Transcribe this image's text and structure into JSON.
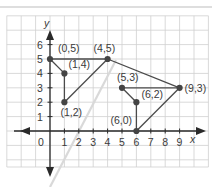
{
  "figure": {
    "title": "",
    "axes": {
      "x_label": "x",
      "y_label": "y",
      "x_ticks": [
        "1",
        "2",
        "3",
        "4",
        "5",
        "6",
        "7",
        "8",
        "9"
      ],
      "y_ticks": [
        "1",
        "2",
        "3",
        "4",
        "5",
        "6"
      ],
      "origin_label": "0"
    },
    "points": [
      {
        "label": "(0,5)",
        "x": 0,
        "y": 5
      },
      {
        "label": "(1,4)",
        "x": 1,
        "y": 4
      },
      {
        "label": "(1,2)",
        "x": 1,
        "y": 2
      },
      {
        "label": "(4,5)",
        "x": 4,
        "y": 5
      },
      {
        "label": "(5,3)",
        "x": 5,
        "y": 3
      },
      {
        "label": "(6,2)",
        "x": 6,
        "y": 2
      },
      {
        "label": "(6,0)",
        "x": 6,
        "y": 0
      },
      {
        "label": "(9,3)",
        "x": 9,
        "y": 3
      }
    ],
    "segments": [
      {
        "from": "(0,5)",
        "to": "(1,4)"
      },
      {
        "from": "(1,4)",
        "to": "(1,2)"
      },
      {
        "from": "(1,2)",
        "to": "(4,5)"
      },
      {
        "from": "(4,5)",
        "to": "(0,5)"
      },
      {
        "from": "(4,5)",
        "to": "(9,3)"
      },
      {
        "from": "(9,3)",
        "to": "(5,3)"
      },
      {
        "from": "(5,3)",
        "to": "(6,2)"
      },
      {
        "from": "(6,2)",
        "to": "(6,0)"
      },
      {
        "from": "(6,0)",
        "to": "(9,3)"
      }
    ],
    "colors": {
      "grid": "#c8c8c8",
      "axis": "#2a2a2a",
      "segment": "#4a4a4a",
      "point": "#444444",
      "text": "#3a3a3a",
      "reflection_line": "#d8d8d8",
      "top_rule": "#bdbdbd"
    }
  }
}
